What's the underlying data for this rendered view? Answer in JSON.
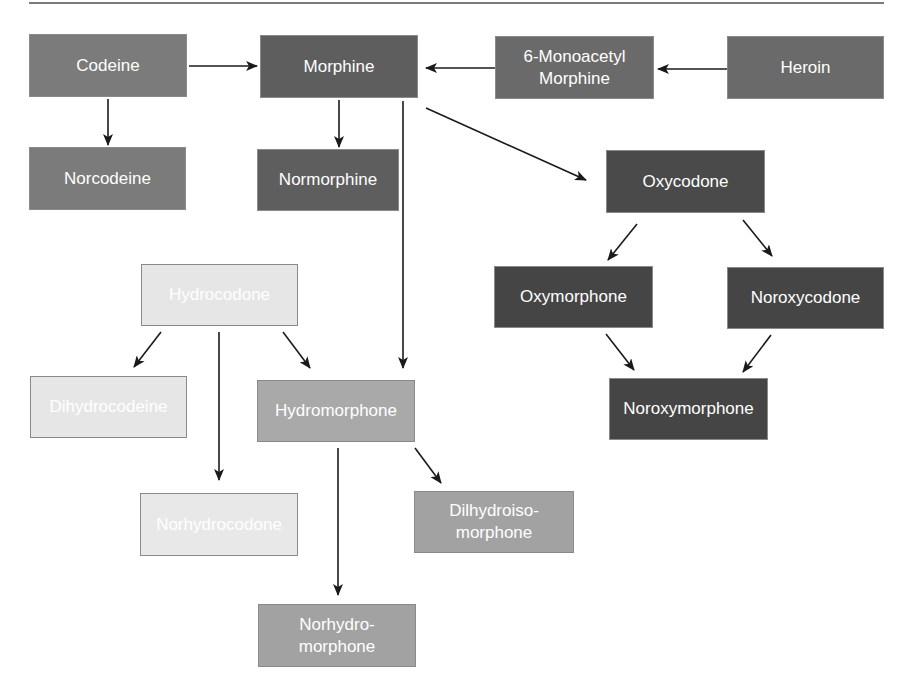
{
  "diagram": {
    "type": "metabolic-pathway",
    "colors": {
      "dark": "#4a4a4a",
      "medium_dark": "#5e5e5e",
      "medium": "#7b7b7b",
      "light": "#a9a9a9",
      "very_light": "#e6e6e6",
      "arrow": "#1a1a1a",
      "rule": "#7a7a7a"
    },
    "nodes": {
      "codeine": {
        "label": "Codeine",
        "x": 29,
        "y": 34,
        "w": 158,
        "h": 63,
        "color": "#7b7b7b"
      },
      "morphine": {
        "label": "Morphine",
        "x": 260,
        "y": 35,
        "w": 158,
        "h": 63,
        "color": "#5e5e5e"
      },
      "monoacetyl_morphine": {
        "label": "6-Monoacetyl\nMorphine",
        "x": 495,
        "y": 36,
        "w": 159,
        "h": 63,
        "color": "#6a6a6a"
      },
      "heroin": {
        "label": "Heroin",
        "x": 727,
        "y": 36,
        "w": 157,
        "h": 63,
        "color": "#6a6a6a"
      },
      "norcodeine": {
        "label": "Norcodeine",
        "x": 29,
        "y": 147,
        "w": 157,
        "h": 63,
        "color": "#7b7b7b"
      },
      "normorphine": {
        "label": "Normorphine",
        "x": 257,
        "y": 149,
        "w": 142,
        "h": 62,
        "color": "#5e5e5e"
      },
      "oxycodone": {
        "label": "Oxycodone",
        "x": 606,
        "y": 150,
        "w": 159,
        "h": 63,
        "color": "#4a4a4a"
      },
      "hydrocodone": {
        "label": "Hydrocodone",
        "x": 141,
        "y": 264,
        "w": 157,
        "h": 62,
        "color": "#e6e6e6"
      },
      "oxymorphone": {
        "label": "Oxymorphone",
        "x": 494,
        "y": 266,
        "w": 159,
        "h": 62,
        "color": "#454545"
      },
      "noroxycodone": {
        "label": "Noroxycodone",
        "x": 727,
        "y": 267,
        "w": 157,
        "h": 62,
        "color": "#454545"
      },
      "dihydrocodeine": {
        "label": "Dihydrocodeine",
        "x": 30,
        "y": 376,
        "w": 157,
        "h": 62,
        "color": "#e6e6e6"
      },
      "hydromorphone": {
        "label": "Hydromorphone",
        "x": 257,
        "y": 380,
        "w": 158,
        "h": 62,
        "color": "#a9a9a9"
      },
      "noroxymorphone": {
        "label": "Noroxymorphone",
        "x": 609,
        "y": 378,
        "w": 159,
        "h": 62,
        "color": "#454545"
      },
      "norhydrocodone": {
        "label": "Norhydrocodone",
        "x": 140,
        "y": 493,
        "w": 158,
        "h": 63,
        "color": "#e8e8e8"
      },
      "dilhydroisomorphone": {
        "label": "Dilhydroiso-\nmorphone",
        "x": 414,
        "y": 491,
        "w": 160,
        "h": 62,
        "color": "#a2a2a2"
      },
      "norhydromorphone": {
        "label": "Norhydro-\nmorphone",
        "x": 258,
        "y": 604,
        "w": 158,
        "h": 63,
        "color": "#a2a2a2"
      }
    },
    "edges": [
      {
        "from": "codeine",
        "to": "morphine",
        "x1": 189,
        "y1": 66,
        "x2": 257,
        "y2": 66
      },
      {
        "from": "heroin",
        "to": "monoacetyl_morphine",
        "x1": 727,
        "y1": 69,
        "x2": 658,
        "y2": 69
      },
      {
        "from": "monoacetyl_morphine",
        "to": "morphine",
        "x1": 495,
        "y1": 68,
        "x2": 426,
        "y2": 68
      },
      {
        "from": "codeine",
        "to": "norcodeine",
        "x1": 108,
        "y1": 99,
        "x2": 108,
        "y2": 145
      },
      {
        "from": "morphine",
        "to": "normorphine",
        "x1": 339,
        "y1": 100,
        "x2": 339,
        "y2": 147
      },
      {
        "from": "morphine",
        "to": "oxycodone",
        "x1": 426,
        "y1": 108,
        "x2": 586,
        "y2": 180
      },
      {
        "from": "morphine",
        "to": "hydromorphone",
        "x1": 403,
        "y1": 101,
        "x2": 403,
        "y2": 368
      },
      {
        "from": "oxycodone",
        "to": "oxymorphone",
        "x1": 637,
        "y1": 224,
        "x2": 608,
        "y2": 260
      },
      {
        "from": "oxycodone",
        "to": "noroxycodone",
        "x1": 743,
        "y1": 220,
        "x2": 772,
        "y2": 256
      },
      {
        "from": "oxymorphone",
        "to": "noroxymorphone",
        "x1": 606,
        "y1": 334,
        "x2": 634,
        "y2": 370
      },
      {
        "from": "noroxycodone",
        "to": "noroxymorphone",
        "x1": 771,
        "y1": 335,
        "x2": 743,
        "y2": 372
      },
      {
        "from": "hydrocodone",
        "to": "dihydrocodeine",
        "x1": 161,
        "y1": 332,
        "x2": 134,
        "y2": 367
      },
      {
        "from": "hydrocodone",
        "to": "norhydrocodone",
        "x1": 219,
        "y1": 332,
        "x2": 219,
        "y2": 480
      },
      {
        "from": "hydrocodone",
        "to": "hydromorphone",
        "x1": 283,
        "y1": 332,
        "x2": 310,
        "y2": 368
      },
      {
        "from": "hydromorphone",
        "to": "norhydromorphone",
        "x1": 338,
        "y1": 448,
        "x2": 338,
        "y2": 595
      },
      {
        "from": "hydromorphone",
        "to": "dilhydroisomorphone",
        "x1": 415,
        "y1": 448,
        "x2": 441,
        "y2": 483
      }
    ]
  }
}
